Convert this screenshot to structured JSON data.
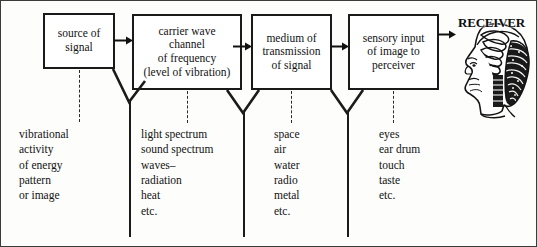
{
  "figure": {
    "background": "#fdfdfb",
    "ink": "#111111"
  },
  "boxes": [
    {
      "name": "source-of-signal",
      "lines": [
        "source  of",
        "signal"
      ]
    },
    {
      "name": "carrier-wave-channel",
      "lines": [
        "carrier  wave",
        "channel",
        "of frequency",
        "(level of vibration)"
      ]
    },
    {
      "name": "medium-of-transmission",
      "lines": [
        "medium of",
        "transmission",
        "of signal"
      ]
    },
    {
      "name": "sensory-input",
      "lines": [
        "sensory input",
        "of image to",
        "perceiver"
      ]
    }
  ],
  "receiver": {
    "label": "RECEIVER",
    "icon": "human-head-brain-profile-icon"
  },
  "arrows": [
    {
      "name": "arrow-source-to-carrier",
      "glyph": "right-arrow-icon"
    },
    {
      "name": "arrow-carrier-to-medium",
      "glyph": "right-arrow-icon"
    },
    {
      "name": "arrow-medium-to-sensory",
      "glyph": "right-arrow-icon"
    },
    {
      "name": "arrow-sensory-to-receiver",
      "glyph": "right-arrow-icon"
    }
  ],
  "columns": [
    {
      "name": "column-source-examples",
      "items": [
        "vibrational",
        "activity",
        "of energy",
        "pattern",
        "or image"
      ]
    },
    {
      "name": "column-carrier-examples",
      "items": [
        "light spectrum",
        "sound spectrum",
        "waves–",
        "radiation",
        "heat",
        "etc."
      ]
    },
    {
      "name": "column-medium-examples",
      "items": [
        "space",
        "air",
        "water",
        "radio",
        "metal",
        "etc."
      ]
    },
    {
      "name": "column-sensory-examples",
      "items": [
        "eyes",
        "ear drum",
        "touch",
        "taste",
        "etc."
      ]
    }
  ]
}
